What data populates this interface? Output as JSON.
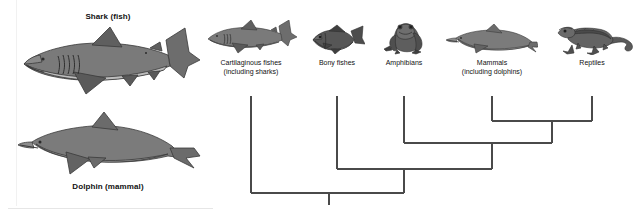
{
  "figure": {
    "type": "cladogram",
    "title_visible": false,
    "background": "#ffffff",
    "line_color": "#4a4a4a"
  },
  "comparison_panel": {
    "items": [
      {
        "id": "shark",
        "label": "Shark (fish)",
        "label_position": "above",
        "icon": "shark-illustration",
        "colors": {
          "body": "#6d6d6d",
          "belly": "#c2c2c2",
          "outline": "#3a3a3a"
        }
      },
      {
        "id": "dolphin",
        "label": "Dolphin (mammal)",
        "label_position": "below",
        "icon": "dolphin-illustration",
        "colors": {
          "body": "#7b7b7b",
          "belly": "#9a9a9a",
          "outline": "#3a3a3a"
        }
      }
    ]
  },
  "cladogram": {
    "taxa": [
      {
        "id": "cartilaginous-fishes",
        "label_line1": "Cartilaginous fishes",
        "label_line2": "(including sharks)",
        "icon": "shark-icon",
        "tip_x": 251
      },
      {
        "id": "bony-fishes",
        "label_line1": "Bony fishes",
        "label_line2": "",
        "icon": "bony-fish-icon",
        "tip_x": 337
      },
      {
        "id": "amphibians",
        "label_line1": "Amphibians",
        "label_line2": "",
        "icon": "frog-icon",
        "tip_x": 404
      },
      {
        "id": "mammals",
        "label_line1": "Mammals",
        "label_line2": "(including dolphins)",
        "icon": "dolphin-icon",
        "tip_x": 492
      },
      {
        "id": "reptiles",
        "label_line1": "Reptiles",
        "label_line2": "",
        "icon": "lizard-icon",
        "tip_x": 592
      }
    ],
    "nodes": [
      {
        "id": "node-mammals-reptiles",
        "children": [
          "mammals",
          "reptiles"
        ],
        "y": 121,
        "stem_x": 552
      },
      {
        "id": "node-amniotes-amphibians",
        "children": [
          "amphibians",
          "node-mammals-reptiles"
        ],
        "y": 143,
        "stem_x": 492
      },
      {
        "id": "node-bony-tetrapods",
        "children": [
          "bony-fishes",
          "node-amniotes-amphibians"
        ],
        "y": 169,
        "stem_x": 404
      },
      {
        "id": "node-root",
        "children": [
          "cartilaginous-fishes",
          "node-bony-tetrapods"
        ],
        "y": 193,
        "stem_x": 329
      }
    ],
    "root_stem": {
      "x": 329,
      "y_top": 193,
      "y_bottom": 205
    },
    "tip_top_y": 96
  }
}
